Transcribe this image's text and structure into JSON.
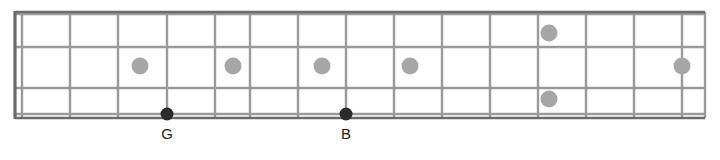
{
  "diagram": {
    "instrument": "guitar",
    "orientation": "horizontal",
    "strings_shown": 4,
    "frets_shown": 14
  },
  "chart_data": {
    "type": "scatter",
    "title": "",
    "xlabel": "",
    "ylabel": "",
    "grid": true,
    "legend": null,
    "board": {
      "left": 15,
      "right": 705,
      "top": 12,
      "bottom": 118,
      "nut_x": 19,
      "fret_spacing": 48.2,
      "fret_x": [
        22,
        70,
        118,
        167,
        215,
        250,
        298,
        346,
        394,
        442,
        490,
        538,
        586,
        634,
        682,
        705
      ],
      "string_y": [
        14,
        47,
        88,
        114
      ],
      "line_color": "#9a9a9a",
      "edge_color": "#6b6b6b",
      "nut_color": "#6b6b6b",
      "background": "#ffffff"
    },
    "series": [
      {
        "name": "open-markers",
        "marker": "filled-circle",
        "color": "#a6a6a6",
        "radius": 8.5,
        "points": [
          {
            "x": 140,
            "y": 66,
            "label": ""
          },
          {
            "x": 233,
            "y": 66,
            "label": ""
          },
          {
            "x": 322,
            "y": 66,
            "label": ""
          },
          {
            "x": 410,
            "y": 66,
            "label": ""
          },
          {
            "x": 549,
            "y": 33,
            "label": ""
          },
          {
            "x": 549,
            "y": 99,
            "label": ""
          },
          {
            "x": 682,
            "y": 66,
            "label": ""
          }
        ]
      },
      {
        "name": "root-notes",
        "marker": "filled-circle",
        "color": "#2b2b2b",
        "radius": 6.5,
        "points": [
          {
            "x": 167,
            "y": 114,
            "label": "G"
          },
          {
            "x": 346,
            "y": 114,
            "label": "B"
          }
        ]
      }
    ],
    "annotations": [
      {
        "text": "G",
        "x": 167,
        "y": 137,
        "color": "#232323"
      },
      {
        "text": "B",
        "x": 346,
        "y": 137,
        "color": "#232323"
      }
    ]
  }
}
